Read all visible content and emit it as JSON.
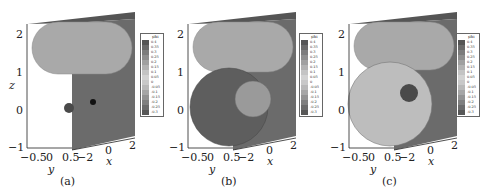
{
  "figure": {
    "panels": [
      {
        "id": "a",
        "caption": "(a)",
        "description": "Capsule-shaped interface above with small drop and small sphere near z=0",
        "z_ticks": [
          "2",
          "1",
          "0",
          "−1"
        ],
        "y_ticks": [
          "−0.5",
          "0",
          "0.5"
        ],
        "x_ticks": [
          "−2",
          "0",
          "2"
        ],
        "xlabel": "x",
        "ylabel": "y",
        "zlabel": "z",
        "colorbar": {
          "title": "phi",
          "labels": [
            "0.4",
            "0.35",
            "0.3",
            "0.25",
            "0.2",
            "0.15",
            "0.1",
            "0.05",
            "0",
            "-0.05",
            "-0.1",
            "-0.15",
            "-0.2",
            "-0.25",
            "-0.3"
          ]
        }
      },
      {
        "id": "b",
        "caption": "(b)",
        "description": "Capsule above large dark sphere with lighter smaller sphere overlapping",
        "z_ticks": [
          "2",
          "1",
          "0",
          "−1"
        ],
        "y_ticks": [
          "−0.5",
          "0",
          "0.5"
        ],
        "x_ticks": [
          "−2",
          "0",
          "2"
        ],
        "xlabel": "x",
        "ylabel": "y",
        "zlabel": "z",
        "colorbar": {
          "title": "phi",
          "labels": [
            "0.4",
            "0.35",
            "0.3",
            "0.25",
            "0.2",
            "0.15",
            "0.1",
            "0.05",
            "0",
            "-0.05",
            "-0.1",
            "-0.15",
            "-0.2",
            "-0.25",
            "-0.3"
          ]
        }
      },
      {
        "id": "c",
        "caption": "(c)",
        "description": "Capsule above large light meshed sphere with small dark inclusion",
        "z_ticks": [
          "2",
          "1",
          "0",
          "−1"
        ],
        "y_ticks": [
          "−0.5",
          "0",
          "0.5"
        ],
        "x_ticks": [
          "−2",
          "0",
          "2"
        ],
        "xlabel": "x",
        "ylabel": "y",
        "zlabel": "z",
        "colorbar": {
          "title": "phi",
          "labels": [
            "0.4",
            "0.35",
            "0.3",
            "0.25",
            "0.2",
            "0.15",
            "0.1",
            "0.05",
            "0",
            "-0.05",
            "-0.1",
            "-0.15",
            "-0.2",
            "-0.25",
            "-0.3"
          ]
        }
      }
    ],
    "colors": {
      "wall": "#6b6b6b",
      "wall_top": "#555555",
      "capsule": "#a9a9a9",
      "sphere_dark_b": "#5e5e5e",
      "sphere_light_b": "#9a9a9a",
      "sphere_light_c": "#bdbdbd",
      "inclusion_c": "#4a4a4a"
    },
    "colorbar_swatches": [
      "#555",
      "#6a6a6a",
      "#7c7c7c",
      "#8e8e8e",
      "#a0a0a0",
      "#b2b2b2",
      "#c4c4c4",
      "#d2d2d2",
      "#c8c8c8",
      "#b8b8b8",
      "#a6a6a6",
      "#939393",
      "#7f7f7f",
      "#6b6b6b",
      "#575757"
    ]
  }
}
